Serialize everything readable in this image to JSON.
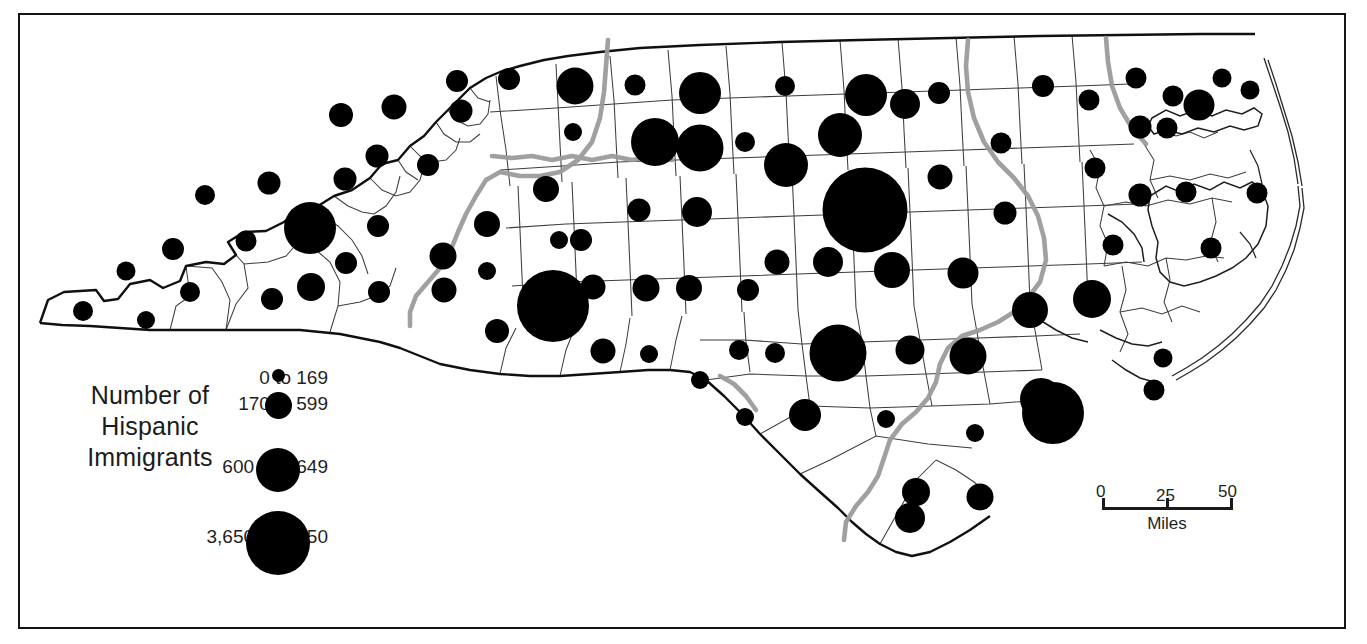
{
  "map": {
    "region_name": "North Carolina",
    "frame": {
      "x": 18,
      "y": 13,
      "w": 1328,
      "h": 616
    },
    "colors": {
      "background": "#ffffff",
      "frame_border": "#141414",
      "state_outline": "#111111",
      "county_outline": "#3a3a3a",
      "symbol_fill": "#000000",
      "highway_gray": "#9a9a9a",
      "text": "#1f1f1f"
    }
  },
  "legend": {
    "title_line_1": "Number of",
    "title_line_2": "Hispanic",
    "title_line_3": "Immigrants",
    "classes": [
      {
        "label": "0 to 169",
        "diameter_px": 13,
        "label_x": 200,
        "label_y": 7,
        "dot_cx": 248,
        "dot_cy": 15
      },
      {
        "label": "170 to 599",
        "diameter_px": 27,
        "label_x": 188,
        "label_y": 33,
        "dot_cx": 248,
        "dot_cy": 45
      },
      {
        "label": "600 to 3,649",
        "diameter_px": 44,
        "label_x": 172,
        "label_y": 97,
        "dot_cx": 248,
        "dot_cy": 110
      },
      {
        "label": "3,650 to 8,350",
        "diameter_px": 64,
        "label_x": 152,
        "label_y": 167,
        "dot_cx": 248,
        "dot_cy": 183
      }
    ]
  },
  "scalebar": {
    "unit_label": "Miles",
    "ticks": [
      {
        "value": "0",
        "pos_frac": 0.0
      },
      {
        "value": "25",
        "pos_frac": 0.5
      },
      {
        "value": "50",
        "pos_frac": 1.0
      }
    ]
  },
  "chart_data": {
    "type": "map",
    "subtype": "proportional-symbol-map",
    "title": "Number of Hispanic Immigrants",
    "region": "North Carolina counties",
    "legend_classes": [
      "0 to 169",
      "170 to 599",
      "600 to 3,649",
      "3,650 to 8,350"
    ],
    "symbol_diameters_px": [
      13,
      27,
      44,
      64
    ],
    "scale": {
      "min": 0,
      "mid": 25,
      "max": 50,
      "units": "Miles"
    },
    "symbols": [
      {
        "cx": 146,
        "cy": 320,
        "d": 18
      },
      {
        "cx": 83,
        "cy": 311,
        "d": 20
      },
      {
        "cx": 126,
        "cy": 271,
        "d": 19
      },
      {
        "cx": 190,
        "cy": 292,
        "d": 20
      },
      {
        "cx": 246,
        "cy": 241,
        "d": 21
      },
      {
        "cx": 272,
        "cy": 299,
        "d": 22
      },
      {
        "cx": 173,
        "cy": 249,
        "d": 22
      },
      {
        "cx": 205,
        "cy": 195,
        "d": 20
      },
      {
        "cx": 269,
        "cy": 183,
        "d": 23
      },
      {
        "cx": 310,
        "cy": 228,
        "d": 52
      },
      {
        "cx": 345,
        "cy": 179,
        "d": 23
      },
      {
        "cx": 311,
        "cy": 287,
        "d": 28
      },
      {
        "cx": 346,
        "cy": 263,
        "d": 22
      },
      {
        "cx": 378,
        "cy": 226,
        "d": 22
      },
      {
        "cx": 379,
        "cy": 292,
        "d": 22
      },
      {
        "cx": 377,
        "cy": 156,
        "d": 23
      },
      {
        "cx": 341,
        "cy": 115,
        "d": 24
      },
      {
        "cx": 394,
        "cy": 107,
        "d": 25
      },
      {
        "cx": 428,
        "cy": 165,
        "d": 22
      },
      {
        "cx": 457,
        "cy": 81,
        "d": 22
      },
      {
        "cx": 461,
        "cy": 111,
        "d": 23
      },
      {
        "cx": 443,
        "cy": 256,
        "d": 27
      },
      {
        "cx": 444,
        "cy": 290,
        "d": 25
      },
      {
        "cx": 487,
        "cy": 224,
        "d": 26
      },
      {
        "cx": 487,
        "cy": 271,
        "d": 18
      },
      {
        "cx": 509,
        "cy": 79,
        "d": 22
      },
      {
        "cx": 546,
        "cy": 189,
        "d": 26
      },
      {
        "cx": 497,
        "cy": 331,
        "d": 24
      },
      {
        "cx": 553,
        "cy": 306,
        "d": 72
      },
      {
        "cx": 603,
        "cy": 351,
        "d": 25
      },
      {
        "cx": 575,
        "cy": 86,
        "d": 37
      },
      {
        "cx": 573,
        "cy": 132,
        "d": 18
      },
      {
        "cx": 581,
        "cy": 240,
        "d": 22
      },
      {
        "cx": 593,
        "cy": 287,
        "d": 25
      },
      {
        "cx": 559,
        "cy": 240,
        "d": 18
      },
      {
        "cx": 635,
        "cy": 85,
        "d": 21
      },
      {
        "cx": 655,
        "cy": 142,
        "d": 48
      },
      {
        "cx": 649,
        "cy": 354,
        "d": 18
      },
      {
        "cx": 646,
        "cy": 288,
        "d": 27
      },
      {
        "cx": 639,
        "cy": 210,
        "d": 23
      },
      {
        "cx": 700,
        "cy": 93,
        "d": 42
      },
      {
        "cx": 700,
        "cy": 148,
        "d": 47
      },
      {
        "cx": 697,
        "cy": 212,
        "d": 30
      },
      {
        "cx": 689,
        "cy": 288,
        "d": 26
      },
      {
        "cx": 700,
        "cy": 380,
        "d": 18
      },
      {
        "cx": 745,
        "cy": 142,
        "d": 20
      },
      {
        "cx": 748,
        "cy": 290,
        "d": 22
      },
      {
        "cx": 739,
        "cy": 350,
        "d": 20
      },
      {
        "cx": 745,
        "cy": 417,
        "d": 18
      },
      {
        "cx": 785,
        "cy": 86,
        "d": 20
      },
      {
        "cx": 786,
        "cy": 165,
        "d": 44
      },
      {
        "cx": 777,
        "cy": 262,
        "d": 25
      },
      {
        "cx": 775,
        "cy": 353,
        "d": 20
      },
      {
        "cx": 805,
        "cy": 415,
        "d": 32
      },
      {
        "cx": 840,
        "cy": 135,
        "d": 44
      },
      {
        "cx": 828,
        "cy": 262,
        "d": 30
      },
      {
        "cx": 838,
        "cy": 353,
        "d": 57
      },
      {
        "cx": 866,
        "cy": 95,
        "d": 42
      },
      {
        "cx": 865,
        "cy": 210,
        "d": 85
      },
      {
        "cx": 886,
        "cy": 419,
        "d": 18
      },
      {
        "cx": 905,
        "cy": 104,
        "d": 30
      },
      {
        "cx": 892,
        "cy": 270,
        "d": 36
      },
      {
        "cx": 910,
        "cy": 350,
        "d": 29
      },
      {
        "cx": 916,
        "cy": 492,
        "d": 28
      },
      {
        "cx": 910,
        "cy": 518,
        "d": 30
      },
      {
        "cx": 939,
        "cy": 93,
        "d": 22
      },
      {
        "cx": 940,
        "cy": 177,
        "d": 25
      },
      {
        "cx": 963,
        "cy": 273,
        "d": 31
      },
      {
        "cx": 968,
        "cy": 356,
        "d": 37
      },
      {
        "cx": 975,
        "cy": 433,
        "d": 18
      },
      {
        "cx": 980,
        "cy": 497,
        "d": 27
      },
      {
        "cx": 1001,
        "cy": 143,
        "d": 21
      },
      {
        "cx": 1005,
        "cy": 213,
        "d": 23
      },
      {
        "cx": 1030,
        "cy": 310,
        "d": 36
      },
      {
        "cx": 1041,
        "cy": 399,
        "d": 42
      },
      {
        "cx": 1053,
        "cy": 413,
        "d": 62
      },
      {
        "cx": 1043,
        "cy": 86,
        "d": 22
      },
      {
        "cx": 1089,
        "cy": 100,
        "d": 21
      },
      {
        "cx": 1092,
        "cy": 299,
        "d": 38
      },
      {
        "cx": 1095,
        "cy": 168,
        "d": 21
      },
      {
        "cx": 1113,
        "cy": 245,
        "d": 21
      },
      {
        "cx": 1136,
        "cy": 78,
        "d": 21
      },
      {
        "cx": 1140,
        "cy": 127,
        "d": 23
      },
      {
        "cx": 1140,
        "cy": 195,
        "d": 23
      },
      {
        "cx": 1154,
        "cy": 390,
        "d": 21
      },
      {
        "cx": 1163,
        "cy": 358,
        "d": 19
      },
      {
        "cx": 1167,
        "cy": 128,
        "d": 21
      },
      {
        "cx": 1173,
        "cy": 96,
        "d": 21
      },
      {
        "cx": 1199,
        "cy": 105,
        "d": 31
      },
      {
        "cx": 1186,
        "cy": 192,
        "d": 21
      },
      {
        "cx": 1211,
        "cy": 248,
        "d": 21
      },
      {
        "cx": 1257,
        "cy": 193,
        "d": 21
      },
      {
        "cx": 1222,
        "cy": 78,
        "d": 19
      },
      {
        "cx": 1250,
        "cy": 90,
        "d": 19
      }
    ]
  }
}
